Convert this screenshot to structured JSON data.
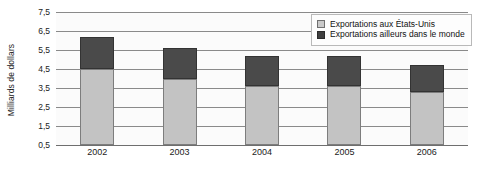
{
  "chart_data": {
    "type": "bar",
    "stacked": true,
    "title": "",
    "subtitle": "",
    "xlabel": "",
    "ylabel": "Milliards de dollars",
    "categories": [
      "2002",
      "2003",
      "2004",
      "2005",
      "2006"
    ],
    "series": [
      {
        "name": "Exportations aux États-Unis",
        "color": "#c3c3c3",
        "values": [
          4.5,
          4.0,
          3.6,
          3.6,
          3.3
        ]
      },
      {
        "name": "Exportations ailleurs dans le monde",
        "color": "#4a4a4a",
        "values": [
          1.7,
          1.6,
          1.6,
          1.6,
          1.4
        ]
      }
    ],
    "totals": [
      6.2,
      5.6,
      5.2,
      5.2,
      4.7
    ],
    "ylim": [
      0.5,
      7.5
    ],
    "ytick_values": [
      0.5,
      1.5,
      2.5,
      3.5,
      4.5,
      5.5,
      6.5,
      7.5
    ],
    "ytick_labels": [
      "0,5",
      "1,5",
      "2,5",
      "3,5",
      "4,5",
      "5,5",
      "6,5",
      "7,5"
    ],
    "grid": true,
    "grid_axis": "y",
    "legend_position": "top-right",
    "legend_entries": [
      "Exportations aux États-Unis",
      "Exportations ailleurs dans le monde"
    ]
  },
  "axes": {
    "y_title": "Milliards de dollars",
    "y_ticks": [
      "7,5",
      "6,5",
      "5,5",
      "4,5",
      "3,5",
      "2,5",
      "1,5",
      "0,5"
    ],
    "x_ticks": [
      "2002",
      "2003",
      "2004",
      "2005",
      "2006"
    ]
  },
  "legend": {
    "items": [
      {
        "label": "Exportations aux États-Unis",
        "swatch": "light-gray-square-icon"
      },
      {
        "label": "Exportations ailleurs dans le monde",
        "swatch": "dark-gray-square-icon"
      }
    ]
  },
  "colors": {
    "series_light": "#c3c3c3",
    "series_dark": "#4a4a4a",
    "gridline": "#8a8a8a",
    "plot_background": "#fbfbfb",
    "page_background": "#ffffff"
  }
}
